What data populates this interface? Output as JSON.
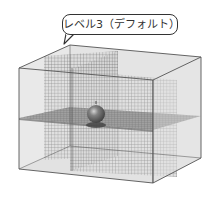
{
  "callout": {
    "label": "レベル3（デフォルト）"
  },
  "figure": {
    "elements": [
      "bounding-box",
      "vertical-slice-plane-x",
      "vertical-slice-plane-y",
      "horizontal-slice-plane",
      "sphere"
    ],
    "colors": {
      "box_face": "#e6e6e6",
      "edge": "#555555",
      "grid_line": "#6a6a6a",
      "horizontal_plane": "#7a7a7a",
      "sphere": "#2e2e2e"
    }
  }
}
